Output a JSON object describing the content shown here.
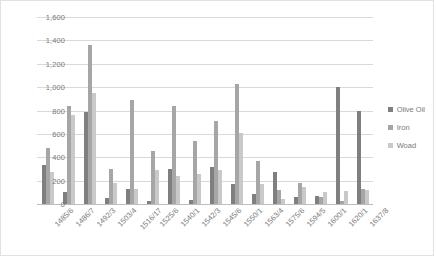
{
  "chart_data": {
    "type": "bar",
    "title": "",
    "xlabel": "",
    "ylabel": "",
    "ylim": [
      0,
      1600
    ],
    "ytick_values": [
      0,
      200,
      400,
      600,
      800,
      1000,
      1200,
      1400,
      1600
    ],
    "ytick_labels": [
      "0",
      "200",
      "400",
      "600",
      "800",
      "1,000",
      "1,200",
      "1,400",
      "1,600"
    ],
    "grid": true,
    "legend_position": "right",
    "categories": [
      "1485/6",
      "1486/7",
      "1492/3",
      "1503/4",
      "1516/17",
      "1525/6",
      "1540/1",
      "1542/3",
      "1545/6",
      "1550/1",
      "1563/4",
      "1575/6",
      "1594/5",
      "1600/1",
      "1620/1",
      "1637/8"
    ],
    "series": [
      {
        "name": "Olive Oil",
        "color": "#7f7f7f",
        "values": [
          330,
          100,
          790,
          55,
          130,
          30,
          300,
          35,
          320,
          175,
          85,
          270,
          60,
          65,
          1000,
          800
        ]
      },
      {
        "name": "Iron",
        "color": "#a6a6a6",
        "values": [
          480,
          840,
          1360,
          300,
          890,
          450,
          840,
          540,
          710,
          1030,
          370,
          120,
          180,
          60,
          30,
          130
        ]
      },
      {
        "name": "Woad",
        "color": "#c9c9c9",
        "values": [
          270,
          760,
          950,
          180,
          130,
          290,
          240,
          260,
          290,
          610,
          170,
          40,
          145,
          100,
          110,
          120
        ]
      }
    ]
  },
  "legend": {
    "items": [
      {
        "label": "Olive Oil"
      },
      {
        "label": "Iron"
      },
      {
        "label": "Woad"
      }
    ]
  }
}
